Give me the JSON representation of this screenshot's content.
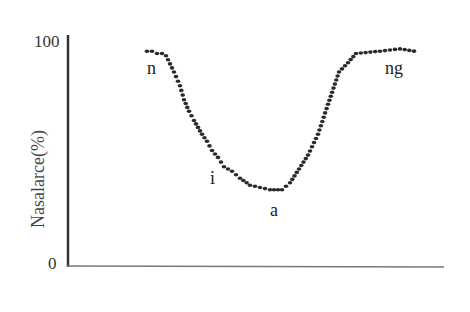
{
  "chart_data": {
    "type": "scatter",
    "title": "",
    "xlabel": "",
    "ylabel": "Nasalarce(%)",
    "ylim": [
      0,
      100
    ],
    "yticks": [
      "0",
      "100"
    ],
    "grid": false,
    "legend": null,
    "x": [
      0,
      5,
      10,
      15,
      19,
      27,
      33,
      37,
      42,
      47,
      51,
      55,
      60,
      65,
      71,
      77,
      85,
      93,
      103,
      113,
      123,
      135,
      143,
      152,
      161,
      171,
      181,
      192,
      201,
      209,
      233,
      253,
      267
    ],
    "values": [
      93,
      93,
      92,
      92,
      91,
      84,
      78,
      72,
      67,
      63,
      60,
      57,
      54,
      50,
      47,
      43,
      41,
      38,
      35,
      34,
      33,
      33,
      36,
      42,
      48,
      57,
      70,
      84,
      88,
      92,
      93,
      94,
      93
    ],
    "annotations": [
      {
        "text": "n",
        "near_value": 92
      },
      {
        "text": "i",
        "near_value": 45
      },
      {
        "text": "a",
        "near_value": 33
      },
      {
        "text": "ng",
        "near_value": 94
      }
    ]
  },
  "labels": {
    "ylabel": "Nasalarce(%)",
    "ytick_top": "100",
    "ytick_bottom": "0",
    "annot_n": "n",
    "annot_i": "i",
    "annot_a": "a",
    "annot_ng": "ng"
  }
}
